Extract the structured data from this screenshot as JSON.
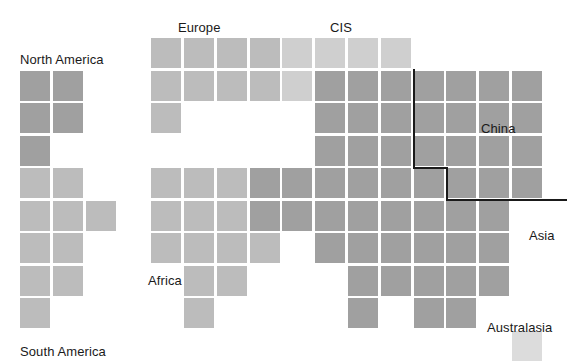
{
  "figure": {
    "type": "cartogram",
    "width": 567,
    "height": 361,
    "background_color": "#ffffff"
  },
  "grid": {
    "origin_x": 20,
    "origin_y": 38,
    "col_pitch": 32.8,
    "row_pitch": 32.5,
    "cell_size": 30,
    "columns": 13,
    "rows": 10
  },
  "palette": {
    "dark": "#8e8e8e",
    "medium": "#a0a0a0",
    "light": "#bcbcbc",
    "pale": "#cfcfcf",
    "faint": "#dcdcdc",
    "outline": "#1a1a1a",
    "label": "#1a1a1a"
  },
  "labels": [
    {
      "name": "north-america",
      "text": "North America",
      "x": 20,
      "y": 53
    },
    {
      "name": "europe",
      "text": "Europe",
      "x": 178,
      "y": 21
    },
    {
      "name": "cis",
      "text": "CIS",
      "x": 330,
      "y": 21
    },
    {
      "name": "china",
      "text": "China",
      "x": 481,
      "y": 122
    },
    {
      "name": "asia",
      "text": "Asia",
      "x": 529,
      "y": 229
    },
    {
      "name": "africa",
      "text": "Africa",
      "x": 148,
      "y": 274
    },
    {
      "name": "south-america",
      "text": "South America",
      "x": 20,
      "y": 345
    },
    {
      "name": "australasia",
      "text": "Australasia",
      "x": 487,
      "y": 321
    }
  ],
  "outline": {
    "name": "china-boundary",
    "stroke_color": "#1a1a1a",
    "stroke_width": 2,
    "points": "[[414,69],[414,168],[447,168],[447,200],[567,200]]"
  },
  "chart_data": {
    "type": "heatmap",
    "title": "",
    "xlabel": "",
    "ylabel": "",
    "grid": false,
    "legend_position": "none",
    "shade_levels": {
      "dark": "#8e8e8e",
      "medium": "#a0a0a0",
      "light": "#bcbcbc",
      "pale": "#cfcfcf",
      "faint": "#dcdcdc"
    },
    "cells": [
      {
        "row": 0,
        "col": 4,
        "shade": "light"
      },
      {
        "row": 0,
        "col": 5,
        "shade": "light"
      },
      {
        "row": 0,
        "col": 6,
        "shade": "light"
      },
      {
        "row": 0,
        "col": 7,
        "shade": "light"
      },
      {
        "row": 0,
        "col": 8,
        "shade": "pale"
      },
      {
        "row": 0,
        "col": 9,
        "shade": "pale"
      },
      {
        "row": 0,
        "col": 10,
        "shade": "pale"
      },
      {
        "row": 0,
        "col": 11,
        "shade": "pale"
      },
      {
        "row": 1,
        "col": 0,
        "shade": "medium"
      },
      {
        "row": 1,
        "col": 1,
        "shade": "medium"
      },
      {
        "row": 1,
        "col": 4,
        "shade": "light"
      },
      {
        "row": 1,
        "col": 5,
        "shade": "light"
      },
      {
        "row": 1,
        "col": 6,
        "shade": "light"
      },
      {
        "row": 1,
        "col": 7,
        "shade": "light"
      },
      {
        "row": 1,
        "col": 8,
        "shade": "pale"
      },
      {
        "row": 1,
        "col": 9,
        "shade": "medium"
      },
      {
        "row": 1,
        "col": 10,
        "shade": "medium"
      },
      {
        "row": 1,
        "col": 11,
        "shade": "medium"
      },
      {
        "row": 1,
        "col": 12,
        "shade": "medium"
      },
      {
        "row": 1,
        "col": 13,
        "shade": "medium"
      },
      {
        "row": 1,
        "col": 14,
        "shade": "medium"
      },
      {
        "row": 1,
        "col": 15,
        "shade": "medium"
      },
      {
        "row": 2,
        "col": 0,
        "shade": "medium"
      },
      {
        "row": 2,
        "col": 1,
        "shade": "medium"
      },
      {
        "row": 2,
        "col": 4,
        "shade": "light"
      },
      {
        "row": 2,
        "col": 9,
        "shade": "medium"
      },
      {
        "row": 2,
        "col": 10,
        "shade": "medium"
      },
      {
        "row": 2,
        "col": 11,
        "shade": "medium"
      },
      {
        "row": 2,
        "col": 12,
        "shade": "medium"
      },
      {
        "row": 2,
        "col": 13,
        "shade": "medium"
      },
      {
        "row": 2,
        "col": 14,
        "shade": "medium"
      },
      {
        "row": 2,
        "col": 15,
        "shade": "medium"
      },
      {
        "row": 3,
        "col": 0,
        "shade": "medium"
      },
      {
        "row": 3,
        "col": 9,
        "shade": "medium"
      },
      {
        "row": 3,
        "col": 10,
        "shade": "medium"
      },
      {
        "row": 3,
        "col": 11,
        "shade": "medium"
      },
      {
        "row": 3,
        "col": 12,
        "shade": "medium"
      },
      {
        "row": 3,
        "col": 13,
        "shade": "medium"
      },
      {
        "row": 3,
        "col": 14,
        "shade": "medium"
      },
      {
        "row": 3,
        "col": 15,
        "shade": "medium"
      },
      {
        "row": 4,
        "col": 0,
        "shade": "light"
      },
      {
        "row": 4,
        "col": 1,
        "shade": "light"
      },
      {
        "row": 4,
        "col": 4,
        "shade": "light"
      },
      {
        "row": 4,
        "col": 5,
        "shade": "light"
      },
      {
        "row": 4,
        "col": 6,
        "shade": "light"
      },
      {
        "row": 4,
        "col": 7,
        "shade": "medium"
      },
      {
        "row": 4,
        "col": 8,
        "shade": "medium"
      },
      {
        "row": 4,
        "col": 9,
        "shade": "medium"
      },
      {
        "row": 4,
        "col": 10,
        "shade": "medium"
      },
      {
        "row": 4,
        "col": 11,
        "shade": "medium"
      },
      {
        "row": 4,
        "col": 12,
        "shade": "medium"
      },
      {
        "row": 4,
        "col": 13,
        "shade": "medium"
      },
      {
        "row": 4,
        "col": 14,
        "shade": "medium"
      },
      {
        "row": 4,
        "col": 15,
        "shade": "medium"
      },
      {
        "row": 5,
        "col": 0,
        "shade": "light"
      },
      {
        "row": 5,
        "col": 1,
        "shade": "light"
      },
      {
        "row": 5,
        "col": 2,
        "shade": "light"
      },
      {
        "row": 5,
        "col": 4,
        "shade": "light"
      },
      {
        "row": 5,
        "col": 5,
        "shade": "light"
      },
      {
        "row": 5,
        "col": 6,
        "shade": "light"
      },
      {
        "row": 5,
        "col": 7,
        "shade": "medium"
      },
      {
        "row": 5,
        "col": 8,
        "shade": "medium"
      },
      {
        "row": 5,
        "col": 9,
        "shade": "medium"
      },
      {
        "row": 5,
        "col": 10,
        "shade": "medium"
      },
      {
        "row": 5,
        "col": 11,
        "shade": "medium"
      },
      {
        "row": 5,
        "col": 12,
        "shade": "medium"
      },
      {
        "row": 5,
        "col": 13,
        "shade": "medium"
      },
      {
        "row": 5,
        "col": 14,
        "shade": "medium"
      },
      {
        "row": 6,
        "col": 0,
        "shade": "light"
      },
      {
        "row": 6,
        "col": 1,
        "shade": "light"
      },
      {
        "row": 6,
        "col": 4,
        "shade": "light"
      },
      {
        "row": 6,
        "col": 5,
        "shade": "light"
      },
      {
        "row": 6,
        "col": 6,
        "shade": "light"
      },
      {
        "row": 6,
        "col": 7,
        "shade": "light"
      },
      {
        "row": 6,
        "col": 9,
        "shade": "medium"
      },
      {
        "row": 6,
        "col": 10,
        "shade": "medium"
      },
      {
        "row": 6,
        "col": 11,
        "shade": "medium"
      },
      {
        "row": 6,
        "col": 12,
        "shade": "medium"
      },
      {
        "row": 6,
        "col": 13,
        "shade": "medium"
      },
      {
        "row": 6,
        "col": 14,
        "shade": "medium"
      },
      {
        "row": 7,
        "col": 0,
        "shade": "light"
      },
      {
        "row": 7,
        "col": 1,
        "shade": "light"
      },
      {
        "row": 7,
        "col": 5,
        "shade": "light"
      },
      {
        "row": 7,
        "col": 6,
        "shade": "light"
      },
      {
        "row": 7,
        "col": 10,
        "shade": "medium"
      },
      {
        "row": 7,
        "col": 11,
        "shade": "medium"
      },
      {
        "row": 7,
        "col": 12,
        "shade": "medium"
      },
      {
        "row": 7,
        "col": 13,
        "shade": "medium"
      },
      {
        "row": 7,
        "col": 14,
        "shade": "medium"
      },
      {
        "row": 8,
        "col": 0,
        "shade": "light"
      },
      {
        "row": 8,
        "col": 5,
        "shade": "light"
      },
      {
        "row": 8,
        "col": 10,
        "shade": "medium"
      },
      {
        "row": 8,
        "col": 12,
        "shade": "medium"
      },
      {
        "row": 8,
        "col": 13,
        "shade": "medium"
      },
      {
        "row": 9,
        "col": 15,
        "shade": "faint"
      }
    ]
  }
}
